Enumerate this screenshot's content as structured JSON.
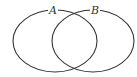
{
  "diagram": {
    "type": "venn",
    "background": "#ffffff",
    "stroke_color": "#333333",
    "sets": [
      {
        "label": "A",
        "cx": 55,
        "cy": 41,
        "rx": 42,
        "ry": 31,
        "label_x": 53,
        "label_y": 14
      },
      {
        "label": "B",
        "cx": 93,
        "cy": 41,
        "rx": 41,
        "ry": 31,
        "label_x": 95,
        "label_y": 14
      }
    ]
  }
}
